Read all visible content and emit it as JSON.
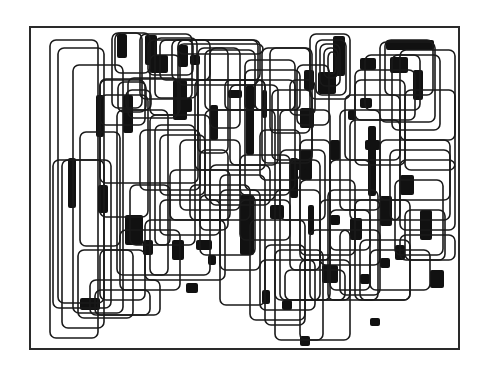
{
  "artwork": {
    "description": "Abstract composition of overlapping rounded rectangles with black filled regions",
    "background": "#ffffff",
    "ink": "#111111",
    "frame": {
      "x": 30,
      "y": 27,
      "w": 429,
      "h": 322
    },
    "corner_radius": 6,
    "rects": [
      [
        50,
        40,
        48,
        298
      ],
      [
        58,
        48,
        46,
        255
      ],
      [
        73,
        65,
        50,
        248
      ],
      [
        53,
        160,
        58,
        148
      ],
      [
        62,
        160,
        42,
        168
      ],
      [
        80,
        132,
        40,
        114
      ],
      [
        78,
        250,
        55,
        68
      ],
      [
        100,
        79,
        98,
        104
      ],
      [
        100,
        95,
        48,
        122
      ],
      [
        115,
        33,
        35,
        40
      ],
      [
        112,
        33,
        30,
        75
      ],
      [
        118,
        82,
        28,
        30
      ],
      [
        128,
        78,
        50,
        40
      ],
      [
        126,
        90,
        25,
        20
      ],
      [
        100,
        80,
        45,
        45
      ],
      [
        117,
        110,
        51,
        165
      ],
      [
        140,
        34,
        52,
        65
      ],
      [
        148,
        40,
        45,
        35
      ],
      [
        155,
        38,
        42,
        60
      ],
      [
        150,
        55,
        30,
        60
      ],
      [
        160,
        40,
        100,
        40
      ],
      [
        172,
        40,
        38,
        40
      ],
      [
        178,
        40,
        80,
        45
      ],
      [
        178,
        44,
        85,
        10
      ],
      [
        198,
        48,
        30,
        105
      ],
      [
        210,
        48,
        30,
        80
      ],
      [
        205,
        50,
        50,
        60
      ],
      [
        195,
        80,
        70,
        90
      ],
      [
        225,
        80,
        40,
        30
      ],
      [
        150,
        115,
        60,
        160
      ],
      [
        155,
        125,
        40,
        120
      ],
      [
        140,
        130,
        60,
        60
      ],
      [
        160,
        135,
        45,
        60
      ],
      [
        180,
        140,
        60,
        70
      ],
      [
        200,
        150,
        28,
        80
      ],
      [
        205,
        110,
        70,
        90
      ],
      [
        230,
        85,
        48,
        80
      ],
      [
        245,
        60,
        50,
        130
      ],
      [
        245,
        70,
        55,
        40
      ],
      [
        255,
        80,
        40,
        30
      ],
      [
        262,
        48,
        50,
        115
      ],
      [
        270,
        48,
        40,
        85
      ],
      [
        272,
        90,
        40,
        70
      ],
      [
        280,
        110,
        50,
        190
      ],
      [
        290,
        80,
        25,
        35
      ],
      [
        297,
        65,
        32,
        60
      ],
      [
        310,
        34,
        40,
        65
      ],
      [
        316,
        40,
        30,
        55
      ],
      [
        320,
        44,
        20,
        42
      ],
      [
        324,
        48,
        14,
        30
      ],
      [
        328,
        52,
        8,
        22
      ],
      [
        300,
        140,
        30,
        120
      ],
      [
        290,
        160,
        30,
        110
      ],
      [
        275,
        190,
        45,
        110
      ],
      [
        220,
        175,
        45,
        130
      ],
      [
        220,
        190,
        40,
        80
      ],
      [
        200,
        195,
        55,
        60
      ],
      [
        240,
        200,
        50,
        40
      ],
      [
        250,
        220,
        55,
        100
      ],
      [
        265,
        245,
        40,
        80
      ],
      [
        275,
        250,
        48,
        90
      ],
      [
        260,
        260,
        55,
        50
      ],
      [
        300,
        260,
        50,
        80
      ],
      [
        285,
        270,
        60,
        30
      ],
      [
        310,
        230,
        40,
        70
      ],
      [
        320,
        200,
        60,
        65
      ],
      [
        328,
        190,
        50,
        110
      ],
      [
        330,
        160,
        40,
        90
      ],
      [
        340,
        110,
        40,
        100
      ],
      [
        350,
        120,
        50,
        100
      ],
      [
        345,
        95,
        55,
        65
      ],
      [
        355,
        80,
        50,
        85
      ],
      [
        355,
        70,
        60,
        50
      ],
      [
        365,
        55,
        55,
        55
      ],
      [
        380,
        42,
        55,
        80
      ],
      [
        385,
        40,
        48,
        55
      ],
      [
        392,
        55,
        48,
        75
      ],
      [
        400,
        50,
        55,
        90
      ],
      [
        405,
        90,
        50,
        80
      ],
      [
        380,
        140,
        70,
        60
      ],
      [
        390,
        150,
        60,
        70
      ],
      [
        400,
        160,
        55,
        70
      ],
      [
        395,
        180,
        48,
        75
      ],
      [
        405,
        210,
        40,
        50
      ],
      [
        400,
        235,
        55,
        25
      ],
      [
        360,
        240,
        50,
        60
      ],
      [
        370,
        250,
        60,
        40
      ],
      [
        355,
        200,
        55,
        100
      ],
      [
        340,
        230,
        40,
        65
      ],
      [
        330,
        210,
        40,
        80
      ],
      [
        300,
        180,
        55,
        75
      ],
      [
        280,
        150,
        45,
        70
      ],
      [
        260,
        130,
        40,
        50
      ],
      [
        240,
        155,
        50,
        40
      ],
      [
        210,
        165,
        60,
        40
      ],
      [
        190,
        185,
        60,
        35
      ],
      [
        170,
        170,
        60,
        50
      ],
      [
        130,
        185,
        40,
        60
      ],
      [
        160,
        200,
        60,
        35
      ],
      [
        145,
        220,
        80,
        60
      ],
      [
        120,
        230,
        60,
        60
      ],
      [
        100,
        250,
        45,
        50
      ],
      [
        90,
        280,
        70,
        35
      ],
      [
        95,
        290,
        55,
        25
      ]
    ],
    "blocks": [
      [
        117,
        34,
        10,
        24
      ],
      [
        145,
        35,
        12,
        30
      ],
      [
        150,
        55,
        18,
        18
      ],
      [
        190,
        55,
        10,
        10
      ],
      [
        178,
        45,
        10,
        22
      ],
      [
        173,
        80,
        14,
        40
      ],
      [
        180,
        98,
        12,
        14
      ],
      [
        123,
        95,
        10,
        38
      ],
      [
        96,
        95,
        8,
        42
      ],
      [
        68,
        158,
        8,
        50
      ],
      [
        98,
        185,
        10,
        28
      ],
      [
        125,
        215,
        18,
        30
      ],
      [
        143,
        240,
        10,
        15
      ],
      [
        172,
        240,
        12,
        20
      ],
      [
        186,
        283,
        12,
        10
      ],
      [
        80,
        298,
        20,
        12
      ],
      [
        210,
        105,
        8,
        35
      ],
      [
        228,
        90,
        14,
        8
      ],
      [
        246,
        85,
        8,
        70
      ],
      [
        262,
        90,
        5,
        28
      ],
      [
        304,
        70,
        10,
        20
      ],
      [
        318,
        72,
        18,
        22
      ],
      [
        333,
        36,
        12,
        40
      ],
      [
        300,
        108,
        14,
        20
      ],
      [
        360,
        58,
        16,
        12
      ],
      [
        386,
        40,
        48,
        10
      ],
      [
        390,
        57,
        18,
        16
      ],
      [
        413,
        70,
        10,
        30
      ],
      [
        360,
        98,
        12,
        10
      ],
      [
        348,
        110,
        8,
        10
      ],
      [
        368,
        126,
        8,
        70
      ],
      [
        365,
        140,
        15,
        10
      ],
      [
        330,
        140,
        10,
        20
      ],
      [
        300,
        150,
        12,
        30
      ],
      [
        296,
        160,
        10,
        10
      ],
      [
        290,
        158,
        8,
        40
      ],
      [
        270,
        205,
        14,
        14
      ],
      [
        240,
        195,
        14,
        60
      ],
      [
        308,
        205,
        6,
        30
      ],
      [
        330,
        215,
        10,
        10
      ],
      [
        350,
        218,
        12,
        22
      ],
      [
        380,
        196,
        12,
        30
      ],
      [
        400,
        175,
        14,
        20
      ],
      [
        420,
        210,
        12,
        30
      ],
      [
        430,
        270,
        14,
        18
      ],
      [
        395,
        245,
        10,
        15
      ],
      [
        380,
        258,
        10,
        10
      ],
      [
        360,
        274,
        10,
        10
      ],
      [
        322,
        265,
        16,
        18
      ],
      [
        262,
        290,
        8,
        14
      ],
      [
        282,
        300,
        10,
        10
      ],
      [
        370,
        318,
        10,
        8
      ],
      [
        300,
        336,
        10,
        10
      ],
      [
        196,
        240,
        16,
        10
      ],
      [
        208,
        255,
        8,
        10
      ]
    ]
  }
}
